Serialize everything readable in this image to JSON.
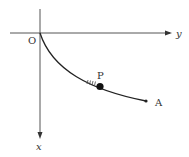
{
  "diagram": {
    "origin_label": "O",
    "y_axis_label": "y",
    "x_axis_label": "x",
    "particle_label": "P",
    "endpoint_label": "A",
    "colors": {
      "line": "#222222",
      "axis": "#555555",
      "text": "#333333",
      "background": "#ffffff"
    }
  }
}
